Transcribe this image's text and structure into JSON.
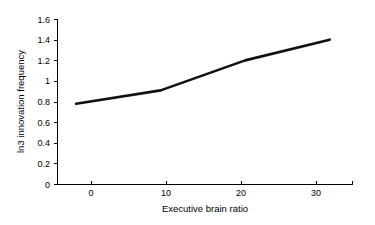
{
  "chart_data": {
    "type": "line",
    "title": "",
    "subtitle": "",
    "xlabel": "Executive brain ratio",
    "ylabel": "ln3 innovation frequency",
    "x": [
      0,
      10,
      20,
      30
    ],
    "values": [
      0.78,
      0.91,
      1.2,
      1.4
    ],
    "series": [
      {
        "name": "ln3 innovation frequency",
        "values": [
          0.78,
          0.91,
          1.2,
          1.4
        ],
        "color": "#111111"
      }
    ],
    "xlim": [
      -2.2,
      32.7
    ],
    "ylim": [
      0,
      1.6
    ],
    "xticks": [
      0,
      10,
      20,
      30
    ],
    "yticks": [
      0,
      0.2,
      0.4,
      0.6,
      0.8,
      1,
      1.2,
      1.4,
      1.6
    ],
    "xtick_labels": [
      "0",
      "10",
      "20",
      "30"
    ],
    "ytick_labels": [
      "0",
      "0.2",
      "0.4",
      "0.6",
      "0.8",
      "1",
      "1.2",
      "1.4",
      "1.6"
    ],
    "grid": false,
    "legend": false,
    "legend_position": "none",
    "annotations": []
  },
  "axes": {
    "y_title": "ln3 innovation frequency",
    "x_title": "Executive brain ratio",
    "y_labels": {
      "t0": "1.6",
      "t1": "1.4",
      "t2": "1.2",
      "t3": "1",
      "t4": "0.8",
      "t5": "0.6",
      "t6": "0.4",
      "t7": "0.2",
      "t8": "0"
    },
    "x_labels": {
      "t0": "0",
      "t1": "10",
      "t2": "20",
      "t3": "30"
    }
  },
  "colors": {
    "background": "#ffffff",
    "axis": "#000000",
    "series": "#111111",
    "text": "#000000"
  }
}
